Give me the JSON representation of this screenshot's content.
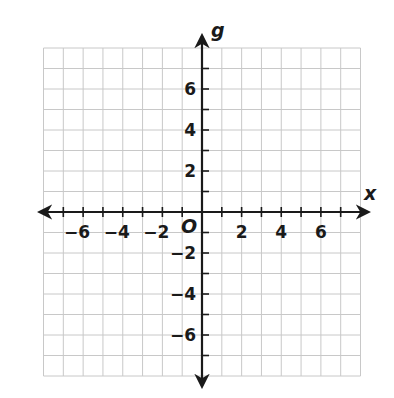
{
  "chart_data": {
    "type": "scatter",
    "title": "",
    "xlabel": "x",
    "ylabel": "g",
    "origin_label": "O",
    "xlim": [
      -8,
      8
    ],
    "ylim": [
      -8,
      8
    ],
    "grid": true,
    "grid_step": 1,
    "x_tick_labels": [
      "−6",
      "−4",
      "−2",
      "2",
      "4",
      "6"
    ],
    "x_tick_values": [
      -6,
      -4,
      -2,
      2,
      4,
      6
    ],
    "y_tick_labels": [
      "6",
      "4",
      "2",
      "−2",
      "−4",
      "−6"
    ],
    "y_tick_values": [
      6,
      4,
      2,
      -2,
      -4,
      -6
    ],
    "series": [],
    "colors": {
      "grid": "#c8c8c8",
      "axis": "#1a1a1a",
      "background": "#ffffff"
    }
  }
}
